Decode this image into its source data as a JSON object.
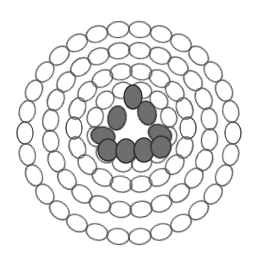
{
  "colors": {
    "background": "#ffffff",
    "outline": "#555555",
    "shade_fill": "#6e6e6e",
    "shade_stroke": "#333333"
  },
  "rings": [
    {
      "name": "outer-ring",
      "cx": 129,
      "cy": 133,
      "radius": 104,
      "count": 30,
      "rx": 11,
      "ry": 8,
      "start_deg": 0
    },
    {
      "name": "second-ring",
      "cx": 130,
      "cy": 130,
      "radius": 80,
      "count": 24,
      "rx": 11,
      "ry": 8,
      "start_deg": 7
    },
    {
      "name": "third-ring",
      "cx": 131,
      "cy": 128,
      "radius": 57,
      "count": 18,
      "rx": 11,
      "ry": 8,
      "start_deg": 0
    },
    {
      "name": "inner-ring",
      "cx": 132,
      "cy": 127,
      "radius": 38,
      "count": 12,
      "rx": 10,
      "ry": 8,
      "start_deg": 15
    }
  ],
  "shaded": [
    {
      "cx": 133,
      "cy": 97,
      "rx": 9,
      "ry": 12,
      "rot": 0
    },
    {
      "cx": 117,
      "cy": 118,
      "rx": 9,
      "ry": 12,
      "rot": 10
    },
    {
      "cx": 147,
      "cy": 113,
      "rx": 9,
      "ry": 12,
      "rot": -15
    },
    {
      "cx": 103,
      "cy": 136,
      "rx": 12,
      "ry": 9,
      "rot": 10
    },
    {
      "cx": 160,
      "cy": 134,
      "rx": 12,
      "ry": 9,
      "rot": 25
    },
    {
      "cx": 108,
      "cy": 150,
      "rx": 10,
      "ry": 11,
      "rot": 0
    },
    {
      "cx": 126,
      "cy": 151,
      "rx": 10,
      "ry": 12,
      "rot": 0
    },
    {
      "cx": 144,
      "cy": 150,
      "rx": 10,
      "ry": 12,
      "rot": 0
    },
    {
      "cx": 161,
      "cy": 147,
      "rx": 10,
      "ry": 11,
      "rot": 10
    }
  ]
}
